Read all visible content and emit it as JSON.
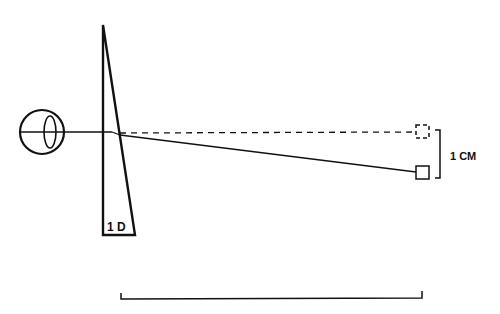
{
  "diagram": {
    "prism_label": "1 D",
    "displacement_label": "1 CM",
    "colors": {
      "stroke": "#111111",
      "background": "#ffffff"
    }
  }
}
